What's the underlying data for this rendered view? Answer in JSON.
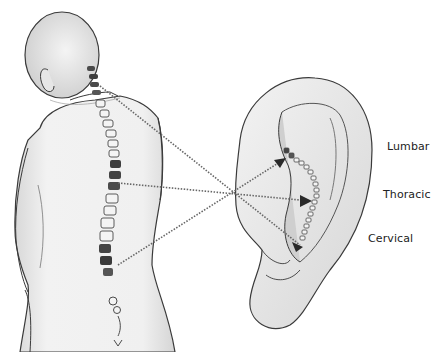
{
  "figure": {
    "labels": {
      "lumbar": "Lumbar",
      "thoracic": "Thoracic",
      "cervical": "Cervical"
    },
    "colors": {
      "ink": "#3a3a3a",
      "skin_shade": "#d9d9d9",
      "background": "#ffffff",
      "vertebra_dark": "#4a4a4a"
    }
  }
}
